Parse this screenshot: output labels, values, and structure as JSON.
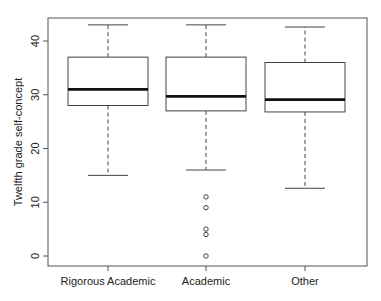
{
  "chart_data": {
    "type": "boxplot",
    "title": "",
    "xlabel": "",
    "ylabel": "Twelfth grade self-concept",
    "ylim": [
      -1.5,
      44.5
    ],
    "yticks": [
      0,
      10,
      20,
      30,
      40
    ],
    "grid": false,
    "legend": null,
    "categories": [
      "Rigorous Academic",
      "Academic",
      "Other"
    ],
    "series": [
      {
        "name": "Rigorous Academic",
        "whisker_low": 15,
        "q1": 28,
        "median": 31,
        "q3": 37,
        "whisker_high": 43,
        "outliers": []
      },
      {
        "name": "Academic",
        "whisker_low": 16,
        "q1": 27,
        "median": 29.7,
        "q3": 37,
        "whisker_high": 43,
        "outliers": [
          11,
          9,
          5,
          4,
          0
        ]
      },
      {
        "name": "Other",
        "whisker_low": 12.6,
        "q1": 26.8,
        "median": 29.1,
        "q3": 36,
        "whisker_high": 42.6,
        "outliers": []
      }
    ]
  }
}
